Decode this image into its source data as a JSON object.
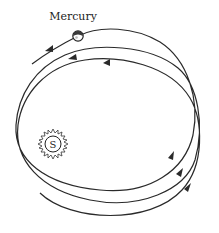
{
  "diagram": {
    "planet_label": "Mercury",
    "sun_label": "S",
    "orbit_loops": 3,
    "direction": "counterclockwise",
    "colors": {
      "line": "#2a2a2a",
      "background": "#ffffff",
      "planet_fill": "#3a3a3a"
    }
  }
}
